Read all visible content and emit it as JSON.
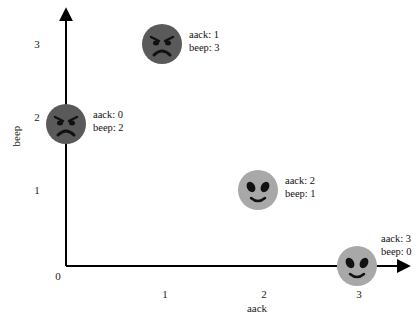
{
  "chart_data": {
    "type": "scatter",
    "title": "",
    "xlabel": "aack",
    "ylabel": "beep",
    "xlim": [
      0,
      3
    ],
    "ylim": [
      0,
      3
    ],
    "origin_label": "0",
    "x_ticks": [
      "1",
      "2",
      "3"
    ],
    "y_ticks": [
      "1",
      "2",
      "3"
    ],
    "grid": false,
    "points": [
      {
        "x": 0,
        "y": 2,
        "marker": "angry-face",
        "label_lines": [
          "aack: 0",
          "beep: 2"
        ]
      },
      {
        "x": 1,
        "y": 3,
        "marker": "angry-face",
        "label_lines": [
          "aack: 1",
          "beep: 3"
        ]
      },
      {
        "x": 2,
        "y": 1,
        "marker": "alien-face",
        "label_lines": [
          "aack: 2",
          "beep: 1"
        ]
      },
      {
        "x": 3,
        "y": 0,
        "marker": "alien-face",
        "label_lines": [
          "aack: 3",
          "beep: 0"
        ]
      }
    ],
    "colors": {
      "angry-face": "#5a5a5a",
      "alien-face": "#a8a8a8",
      "axis": "#000000"
    }
  }
}
